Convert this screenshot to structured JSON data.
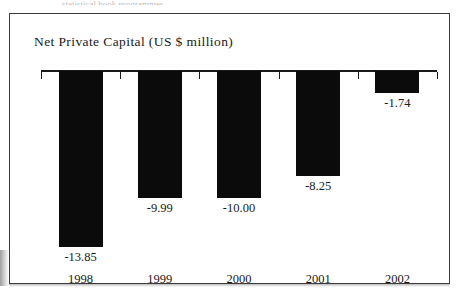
{
  "scan": {
    "top_text_sliver": "statistical book programmes"
  },
  "figure": {
    "title": "Net Private Capital (US $ million)"
  },
  "chart_data": {
    "type": "bar",
    "title": "Net Private Capital (US $ million)",
    "xlabel": "",
    "ylabel": "US $ million",
    "categories": [
      "1998",
      "1999",
      "2000",
      "2001",
      "2002"
    ],
    "values": [
      -13.85,
      -10.0,
      -9.99,
      -8.25,
      -1.74
    ],
    "value_labels": [
      "-13.85",
      "-9.99",
      "-10.00",
      "-8.25",
      "-1.74"
    ],
    "series": [
      {
        "name": "Net Private Capital",
        "values": [
          -13.85,
          -9.99,
          -10.0,
          -8.25,
          -1.74
        ]
      }
    ],
    "points": [
      {
        "category": "1998",
        "value": -13.85,
        "label": "-13.85"
      },
      {
        "category": "1999",
        "value": -9.99,
        "label": "-9.99"
      },
      {
        "category": "2000",
        "value": -10.0,
        "label": "-10.00"
      },
      {
        "category": "2001",
        "value": -8.25,
        "label": "-8.25"
      },
      {
        "category": "2002",
        "value": -1.74,
        "label": "-1.74"
      }
    ],
    "ylim": [
      -15.0,
      0.0
    ],
    "grid": false,
    "legend": false,
    "bar_color": "#0b0b0b",
    "axis_color": "#1a1a1a",
    "orientation": "vertical",
    "zero_axis_position": "top"
  }
}
